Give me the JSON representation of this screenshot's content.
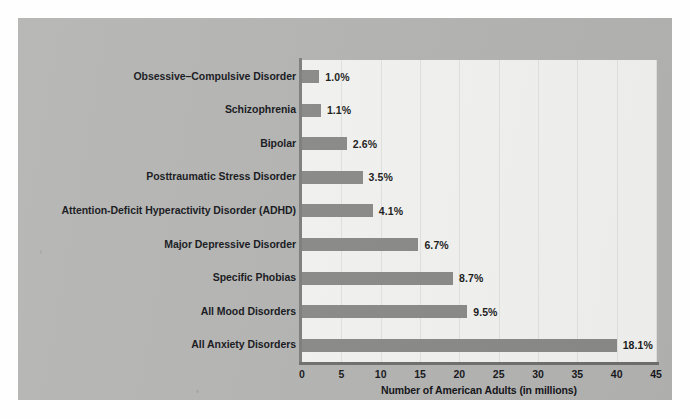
{
  "chart_data": {
    "type": "bar",
    "orientation": "horizontal",
    "title": "",
    "subtitle": "",
    "xlabel": "Number of American Adults (in millions)",
    "ylabel": "",
    "xlim": [
      0,
      45
    ],
    "xticks": [
      0,
      5,
      10,
      15,
      20,
      25,
      30,
      35,
      40,
      45
    ],
    "grid": "vertical",
    "legend": "none",
    "categories": [
      "Obsessive–Compulsive Disorder",
      "Schizophrenia",
      "Bipolar",
      "Posttraumatic Stress Disorder",
      "Attention-Deficit Hyperactivity Disorder (ADHD)",
      "Major Depressive Disorder",
      "Specific Phobias",
      "All Mood Disorders",
      "All Anxiety Disorders"
    ],
    "values": [
      2.2,
      2.4,
      5.7,
      7.7,
      9.0,
      14.8,
      19.2,
      21.0,
      40.0
    ],
    "data_labels": [
      "1.0%",
      "1.1%",
      "2.6%",
      "3.5%",
      "4.1%",
      "6.7%",
      "8.7%",
      "9.5%",
      "18.1%"
    ],
    "percent_values": [
      1.0,
      1.1,
      2.6,
      3.5,
      4.1,
      6.7,
      8.7,
      9.5,
      18.1
    ],
    "units": "millions of American adults"
  },
  "colors": {
    "figure_background": "#b4b5b3",
    "plot_background": "#f3f3f1",
    "bar": "#8a8b89",
    "gridline": "#e2e2e0",
    "axis": "#72736f",
    "text": "#15151a"
  }
}
